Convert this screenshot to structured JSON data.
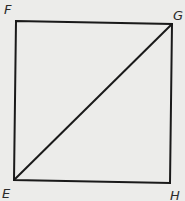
{
  "diagram": {
    "type": "square-with-diagonal",
    "vertices": {
      "F": {
        "label": "F",
        "x": 16,
        "y": 21
      },
      "G": {
        "label": "G",
        "x": 172,
        "y": 24
      },
      "H": {
        "label": "H",
        "x": 170,
        "y": 183
      },
      "E": {
        "label": "E",
        "x": 14,
        "y": 180
      }
    },
    "edges": [
      [
        "E",
        "F"
      ],
      [
        "F",
        "G"
      ],
      [
        "G",
        "H"
      ],
      [
        "H",
        "E"
      ]
    ],
    "diagonal": [
      "E",
      "G"
    ],
    "colors": {
      "line": "#1a1a1a",
      "background": "#ececea"
    }
  }
}
